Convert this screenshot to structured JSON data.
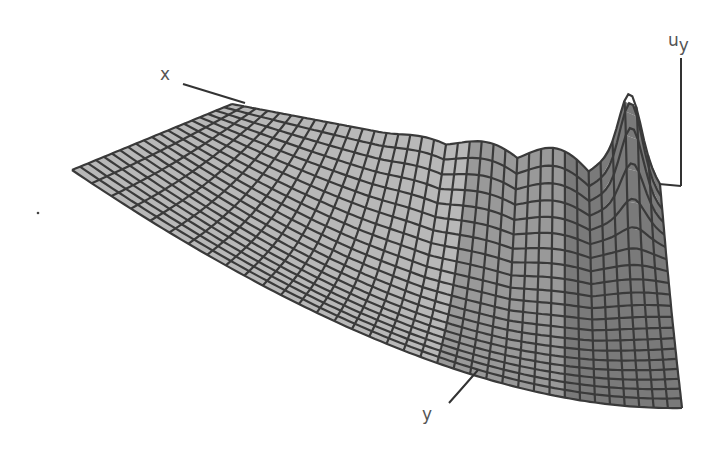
{
  "figure": {
    "type": "3d-wireframe-surface",
    "background": "#ffffff",
    "surface_fill_light": "#b8b8b8",
    "surface_fill_dark": "#7a7a7a",
    "mesh_color": "#3a3a3a",
    "axis_color": "#333333",
    "grid_rows": 20,
    "grid_cols": 36
  },
  "axes": {
    "x_label": "x",
    "y_label": "y",
    "z_label_base": "u",
    "z_label_sub": "y"
  },
  "geometry": {
    "corner_left": [
      72,
      170
    ],
    "corner_back": [
      232,
      104
    ],
    "corner_back_right": [
      660,
      185
    ],
    "corner_front_right": [
      682,
      408
    ],
    "corner_front_bottom": [
      430,
      372
    ],
    "peak": [
      648,
      142
    ],
    "x_axis_start": [
      183,
      84
    ],
    "x_axis_end": [
      245,
      103
    ],
    "z_axis_top": [
      681,
      58
    ],
    "z_axis_bottom": [
      681,
      186
    ],
    "y_axis_start": [
      449,
      403
    ],
    "y_axis_end": [
      478,
      370
    ]
  }
}
